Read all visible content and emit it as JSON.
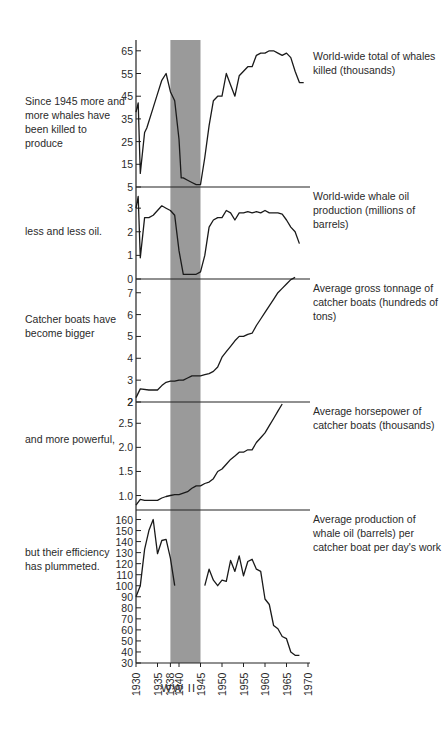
{
  "chart_data": {
    "type": "line",
    "x_axis": {
      "range": [
        1930,
        1970
      ],
      "tick_labels": [
        "1930",
        "1935",
        "1938",
        "1940",
        "1945",
        "1950",
        "1955",
        "1960",
        "1965",
        "1970"
      ]
    },
    "shaded_band": {
      "from": 1938,
      "to": 1945,
      "label": "WW II",
      "color": "#9a9a9a"
    },
    "panels": [
      {
        "id": "whales_killed",
        "label": "World-wide total of whales killed (thousands)",
        "annotation": "Since 1945 more and more whales have been killed to produce",
        "ylim": [
          5,
          68
        ],
        "ticks": [
          5,
          15,
          25,
          35,
          45,
          55,
          65
        ],
        "x": [
          1930,
          1930.5,
          1931,
          1932,
          1932.5,
          1934,
          1935,
          1936,
          1937,
          1938,
          1939,
          1940,
          1940.5,
          1941,
          1942,
          1943,
          1944,
          1945,
          1946,
          1947,
          1948,
          1949,
          1950,
          1951,
          1952,
          1953,
          1954,
          1955,
          1956,
          1957,
          1958,
          1959,
          1960,
          1961,
          1962,
          1963,
          1964,
          1965,
          1966,
          1967,
          1968,
          1969
        ],
        "y": [
          38,
          42,
          11,
          29,
          31,
          40,
          46,
          52,
          55,
          47,
          43,
          26,
          9,
          9,
          8,
          7,
          6,
          6,
          18,
          32,
          43,
          45,
          45,
          55,
          50,
          45,
          54,
          56,
          58,
          58,
          63,
          64,
          64,
          65,
          65,
          64,
          63,
          64,
          62,
          56,
          51,
          51
        ]
      },
      {
        "id": "oil_production",
        "label": "World-wide whale oil production (millions of barrels)",
        "annotation": "less and less oil.",
        "ylim": [
          0,
          3.6
        ],
        "ticks": [
          0,
          1,
          2,
          3
        ],
        "x": [
          1930,
          1930.5,
          1931,
          1932,
          1933,
          1934,
          1935,
          1936,
          1937,
          1938,
          1939,
          1940,
          1941,
          1942,
          1943,
          1944,
          1945,
          1946,
          1947,
          1948,
          1949,
          1950,
          1951,
          1952,
          1953,
          1954,
          1955,
          1956,
          1957,
          1958,
          1959,
          1960,
          1961,
          1962,
          1963,
          1964,
          1965,
          1966,
          1967,
          1968
        ],
        "y": [
          3.0,
          3.5,
          0.9,
          2.6,
          2.6,
          2.7,
          2.9,
          3.1,
          3.0,
          2.9,
          2.7,
          1.2,
          0.2,
          0.2,
          0.2,
          0.2,
          0.3,
          1.0,
          2.2,
          2.5,
          2.6,
          2.6,
          2.9,
          2.8,
          2.5,
          2.8,
          2.8,
          2.85,
          2.8,
          2.85,
          2.8,
          2.9,
          2.8,
          2.8,
          2.8,
          2.75,
          2.5,
          2.2,
          2.0,
          1.5
        ]
      },
      {
        "id": "gross_tonnage",
        "label": "Average gross tonnage of catcher boats (hundreds of tons)",
        "annotation": "Catcher boats have become bigger",
        "ylim": [
          2,
          7.4
        ],
        "ticks": [
          2,
          3,
          4,
          5,
          6,
          7
        ],
        "x": [
          1930,
          1931,
          1933,
          1935,
          1936,
          1937,
          1938,
          1939,
          1940,
          1941,
          1942,
          1943,
          1944,
          1945,
          1946,
          1947,
          1948,
          1949,
          1950,
          1951,
          1952,
          1953,
          1954,
          1955,
          1956,
          1957,
          1958,
          1959,
          1960,
          1961,
          1962,
          1963,
          1964,
          1965,
          1966,
          1967
        ],
        "y": [
          2.2,
          2.6,
          2.55,
          2.55,
          2.75,
          2.9,
          2.95,
          2.95,
          3.0,
          3.0,
          3.1,
          3.2,
          3.2,
          3.2,
          3.25,
          3.3,
          3.4,
          3.6,
          4.05,
          4.3,
          4.55,
          4.8,
          5.0,
          5.0,
          5.1,
          5.15,
          5.5,
          5.8,
          6.1,
          6.4,
          6.7,
          7.0,
          7.2,
          7.4,
          7.6,
          7.7
        ]
      },
      {
        "id": "horsepower",
        "label": "Average horsepower of catcher boats (thousands)",
        "annotation": "and more powerful,",
        "ylim": [
          0.7,
          2.9
        ],
        "ticks": [
          1.0,
          1.5,
          2.0,
          2.5
        ],
        "top_tick_label": "2",
        "x": [
          1930,
          1931,
          1932,
          1934,
          1935,
          1936,
          1937,
          1938,
          1939,
          1940,
          1941,
          1942,
          1943,
          1944,
          1945,
          1946,
          1947,
          1948,
          1949,
          1950,
          1951,
          1952,
          1953,
          1954,
          1955,
          1956,
          1957,
          1958,
          1959,
          1960,
          1961,
          1962,
          1963,
          1964
        ],
        "y": [
          0.8,
          0.92,
          0.9,
          0.9,
          0.9,
          0.95,
          0.98,
          1.0,
          1.02,
          1.02,
          1.05,
          1.08,
          1.15,
          1.2,
          1.2,
          1.25,
          1.28,
          1.35,
          1.5,
          1.55,
          1.65,
          1.75,
          1.82,
          1.9,
          1.9,
          1.95,
          1.95,
          2.1,
          2.2,
          2.3,
          2.45,
          2.6,
          2.75,
          2.9
        ]
      },
      {
        "id": "oil_per_boat_day",
        "label": "Average production of whale oil (barrels) per catcher boat per day's work",
        "annotation": "but their efficiency has plummeted.",
        "ylim": [
          30,
          165
        ],
        "ticks": [
          30,
          40,
          50,
          60,
          70,
          80,
          90,
          100,
          110,
          120,
          130,
          140,
          150,
          160
        ],
        "segments": [
          {
            "x": [
              1930,
              1931,
              1932,
              1933,
              1934,
              1935,
              1936,
              1937,
              1938,
              1939
            ],
            "y": [
              90,
              100,
              133,
              150,
              160,
              129,
              141,
              142,
              125,
              100
            ]
          },
          {
            "x": [
              1946,
              1947,
              1948,
              1949,
              1950,
              1951,
              1952,
              1953,
              1954,
              1955,
              1956,
              1957,
              1958,
              1959,
              1960,
              1961,
              1962,
              1963,
              1964,
              1965,
              1966,
              1967,
              1968
            ],
            "y": [
              100,
              115,
              105,
              100,
              105,
              104,
              123,
              113,
              127,
              109,
              122,
              124,
              115,
              113,
              88,
              83,
              64,
              61,
              54,
              52,
              40,
              37,
              37
            ]
          }
        ]
      }
    ]
  },
  "labels": {
    "left_notes": [
      "Since 1945 more and more whales have been killed to produce",
      "less and less oil.",
      "Catcher boats have become bigger",
      "and more powerful,",
      "but their efficiency has plummeted."
    ],
    "right_notes": [
      "World-wide total of whales killed (thousands)",
      "World-wide whale oil production (millions of barrels)",
      "Average gross tonnage of catcher boats (hundreds of tons)",
      "Average horsepower of catcher boats (thousands)",
      "Average production of whale oil (barrels) per catcher boat per day's work"
    ],
    "band_label": "WW II"
  }
}
